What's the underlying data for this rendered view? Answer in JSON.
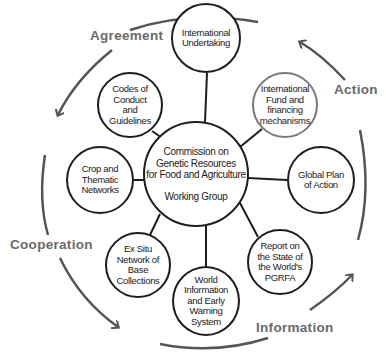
{
  "diagram": {
    "center": {
      "title": "Commission on\nGenetic Resources\nfor Food and Agriculture",
      "subtitle": "Working Group"
    },
    "nodes": [
      {
        "id": "international-undertaking",
        "label": "International\nUndertaking"
      },
      {
        "id": "international-fund",
        "label": "International\nFund and\nfinancing\nmechanisms"
      },
      {
        "id": "global-plan",
        "label": "Global Plan\nof Action"
      },
      {
        "id": "report-state",
        "label": "Report on\nthe State of\nthe World's\nPGRFA"
      },
      {
        "id": "world-information",
        "label": "World\nInformation\nand Early\nWarning\nSystem"
      },
      {
        "id": "ex-situ",
        "label": "Ex Situ\nNetwork of\nBase\nCollections"
      },
      {
        "id": "crop-networks",
        "label": "Crop and\nThematic\nNetworks"
      },
      {
        "id": "codes-conduct",
        "label": "Codes of\nConduct\nand\nGuidelines"
      }
    ],
    "cycle_labels": {
      "agreement": "Agreement",
      "action": "Action",
      "information": "Information",
      "cooperation": "Cooperation"
    },
    "colors": {
      "stroke": "#1e1e1e",
      "arrow": "#555555",
      "label": "#6a6a6a",
      "gray_node": "#7a7a7a"
    }
  }
}
